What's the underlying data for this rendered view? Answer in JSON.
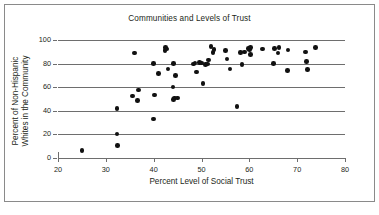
{
  "chart_data": {
    "type": "scatter",
    "title": "Communities and Levels of Trust",
    "xlabel": "Percent Level of Social Trust",
    "ylabel_line1": "Percent of Non-Hispanic",
    "ylabel_line2": "Whites in the Community",
    "ylabel": "Percent of Non-Hispanic Whites in the Community",
    "xlim": [
      20,
      80
    ],
    "ylim": [
      0,
      100
    ],
    "xticks": [
      20,
      30,
      40,
      50,
      60,
      70,
      80
    ],
    "yticks": [
      0,
      20,
      40,
      60,
      80,
      100
    ],
    "grid": "horizontal",
    "legend": "none",
    "marker_color": "#111111",
    "grid_color": "#6e6e6e",
    "points": [
      [
        25.0,
        6.5
      ],
      [
        32.3,
        20.5
      ],
      [
        32.4,
        10.5
      ],
      [
        32.3,
        42.0
      ],
      [
        35.6,
        52.5
      ],
      [
        36.0,
        89.0
      ],
      [
        36.6,
        48.5
      ],
      [
        36.8,
        57.5
      ],
      [
        40.0,
        33.0
      ],
      [
        40.0,
        80.0
      ],
      [
        40.2,
        53.5
      ],
      [
        41.0,
        71.5
      ],
      [
        42.4,
        91.0
      ],
      [
        42.5,
        93.5
      ],
      [
        42.7,
        92.5
      ],
      [
        43.0,
        75.5
      ],
      [
        44.0,
        60.0
      ],
      [
        44.1,
        80.0
      ],
      [
        44.2,
        49.5
      ],
      [
        44.4,
        51.0
      ],
      [
        44.6,
        70.0
      ],
      [
        45.0,
        51.0
      ],
      [
        48.3,
        79.5
      ],
      [
        48.6,
        80.5
      ],
      [
        49.0,
        73.0
      ],
      [
        49.6,
        81.0
      ],
      [
        50.0,
        80.5
      ],
      [
        50.3,
        63.0
      ],
      [
        50.8,
        79.0
      ],
      [
        51.2,
        79.5
      ],
      [
        51.5,
        83.0
      ],
      [
        52.0,
        94.5
      ],
      [
        52.4,
        89.5
      ],
      [
        52.6,
        92.0
      ],
      [
        55.0,
        91.0
      ],
      [
        55.3,
        84.0
      ],
      [
        56.0,
        75.5
      ],
      [
        57.4,
        43.5
      ],
      [
        58.2,
        89.5
      ],
      [
        58.5,
        79.0
      ],
      [
        59.0,
        90.0
      ],
      [
        59.8,
        93.0
      ],
      [
        60.0,
        92.0
      ],
      [
        60.2,
        87.5
      ],
      [
        60.3,
        93.5
      ],
      [
        62.8,
        92.5
      ],
      [
        65.0,
        80.0
      ],
      [
        65.3,
        93.0
      ],
      [
        66.0,
        89.0
      ],
      [
        66.2,
        93.5
      ],
      [
        68.0,
        74.0
      ],
      [
        68.1,
        91.5
      ],
      [
        71.8,
        90.0
      ],
      [
        72.0,
        82.0
      ],
      [
        72.2,
        75.0
      ],
      [
        73.8,
        93.5
      ]
    ]
  }
}
